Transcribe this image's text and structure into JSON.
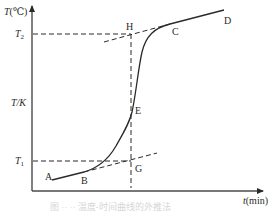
{
  "diagram": {
    "type": "temperature-time curve with tangent construction",
    "y_axis": {
      "label_var": "T",
      "label_unit": "(℃)",
      "mid_label": "T/K"
    },
    "x_axis": {
      "label_var": "t",
      "label_unit": "(min)"
    },
    "levels": {
      "upper": "T",
      "upper_sub": "2",
      "lower": "T",
      "lower_sub": "1"
    },
    "points": {
      "A": "A",
      "B": "B",
      "C": "C",
      "D": "D",
      "E": "E",
      "G": "G",
      "H": "H"
    },
    "caption": "图 ·· ·· 温度-时间曲线的外推法"
  },
  "colors": {
    "line": "#2a2a2a",
    "axis": "#555555",
    "background": "#ffffff"
  }
}
